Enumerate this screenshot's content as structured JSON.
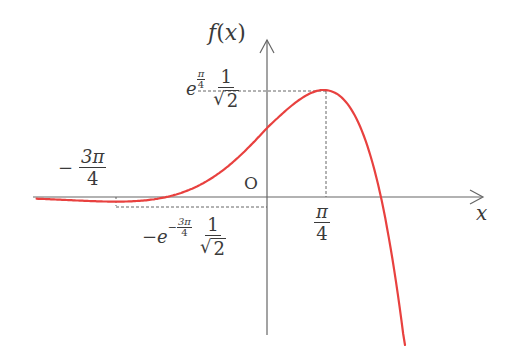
{
  "chart_data": {
    "type": "line",
    "title": "",
    "function": "f(x) = e^x cos x",
    "xlabel": "x",
    "ylabel": "f(x)",
    "origin_label": "O",
    "grid": false,
    "legend": null,
    "line_color": "#e8413f",
    "axis_color": "#555555",
    "xlim": [
      -3.6,
      3.0
    ],
    "ylim": [
      -2.0,
      2.3
    ],
    "series": [
      {
        "name": "f(x)",
        "x": [
          -3.6,
          -3.2,
          -2.8,
          -2.356,
          -2.0,
          -1.5708,
          -1.2,
          -0.8,
          -0.4,
          0.0,
          0.4,
          0.7854,
          1.0,
          1.2,
          1.4,
          1.5708,
          1.8,
          2.0,
          2.2,
          2.35
        ],
        "y": [
          -0.025,
          -0.041,
          -0.057,
          -0.067,
          -0.056,
          0.0,
          0.109,
          0.313,
          0.614,
          1.0,
          1.374,
          1.551,
          1.469,
          1.203,
          0.689,
          0.0,
          -1.374,
          -3.075,
          -5.319,
          -7.33
        ]
      }
    ],
    "annotations": {
      "max_point": {
        "x": 0.7854,
        "y": 1.551,
        "x_label_num": "π",
        "x_label_den": "4",
        "y_label": "e^{π/4} · 1/√2"
      },
      "min_point": {
        "x": -2.356,
        "y": -0.067,
        "x_label": "−3π/4",
        "y_label": "−e^{−3π/4} · 1/√2"
      },
      "zeros": [
        -1.5708,
        1.5708
      ],
      "y_intercept": 1
    }
  },
  "labels": {
    "y_axis": {
      "f": "f",
      "paren_open": "(",
      "x": "x",
      "paren_close": ")"
    },
    "x_axis": "x",
    "origin": "O",
    "max_y": {
      "e": "e",
      "exp_num": "π",
      "exp_den": "4",
      "frac_num": "1",
      "sqrt_arg": "2"
    },
    "min_y": {
      "minus": "−",
      "e": "e",
      "exp_sign": "−",
      "exp_num": "3π",
      "exp_den": "4",
      "frac_num": "1",
      "sqrt_arg": "2"
    },
    "max_x": {
      "num": "π",
      "den": "4"
    },
    "min_x": {
      "minus": "−",
      "num": "3π",
      "den": "4"
    }
  }
}
